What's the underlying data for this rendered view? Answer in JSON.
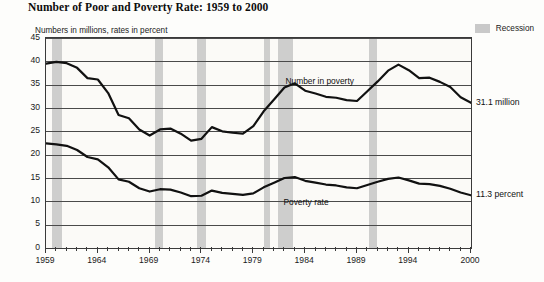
{
  "header": {
    "title": "Number of Poor and Poverty Rate:  1959 to 2000",
    "subtitle": "Numbers in millions, rates in percent",
    "legend_label": "Recession",
    "legend_color": "#c6c6c6"
  },
  "annotations": {
    "series1_inline": "Number in poverty",
    "series2_inline": "Poverty rate",
    "series1_end": "31.1 million",
    "series2_end": "11.3 percent"
  },
  "chart_data": {
    "type": "line",
    "title": "Number of Poor and Poverty Rate:  1959 to 2000",
    "subtitle": "Numbers in millions, rates in percent",
    "xlabel": "",
    "ylabel": "",
    "xlim": [
      1959,
      2000
    ],
    "ylim": [
      0,
      45
    ],
    "yticks": [
      0,
      5,
      10,
      15,
      20,
      25,
      30,
      35,
      40,
      45
    ],
    "xticks_labeled": [
      1959,
      1964,
      1969,
      1974,
      1979,
      1984,
      1989,
      1994,
      2000
    ],
    "xtick_interval": 1,
    "grid": true,
    "legend_position": "top-right",
    "x": [
      1959,
      1960,
      1961,
      1962,
      1963,
      1964,
      1965,
      1966,
      1967,
      1968,
      1969,
      1970,
      1971,
      1972,
      1973,
      1974,
      1975,
      1976,
      1977,
      1978,
      1979,
      1980,
      1981,
      1982,
      1983,
      1984,
      1985,
      1986,
      1987,
      1988,
      1989,
      1990,
      1991,
      1992,
      1993,
      1994,
      1995,
      1996,
      1997,
      1998,
      1999,
      2000
    ],
    "series": [
      {
        "name": "Number in poverty",
        "units": "millions",
        "end_label": "31.1 million",
        "values": [
          39.5,
          39.9,
          39.6,
          38.6,
          36.4,
          36.1,
          33.2,
          28.5,
          27.8,
          25.4,
          24.1,
          25.4,
          25.6,
          24.5,
          23.0,
          23.4,
          25.9,
          25.0,
          24.7,
          24.5,
          26.1,
          29.3,
          31.8,
          34.4,
          35.3,
          33.7,
          33.1,
          32.4,
          32.2,
          31.7,
          31.5,
          33.6,
          35.7,
          38.0,
          39.3,
          38.1,
          36.4,
          36.5,
          35.6,
          34.5,
          32.3,
          31.1
        ]
      },
      {
        "name": "Poverty rate",
        "units": "percent",
        "end_label": "11.3 percent",
        "values": [
          22.4,
          22.2,
          21.9,
          21.0,
          19.5,
          19.0,
          17.3,
          14.7,
          14.2,
          12.8,
          12.1,
          12.6,
          12.5,
          11.9,
          11.1,
          11.2,
          12.3,
          11.8,
          11.6,
          11.4,
          11.7,
          13.0,
          14.0,
          15.0,
          15.2,
          14.4,
          14.0,
          13.6,
          13.4,
          13.0,
          12.8,
          13.5,
          14.2,
          14.8,
          15.1,
          14.5,
          13.8,
          13.7,
          13.3,
          12.7,
          11.9,
          11.3
        ]
      }
    ],
    "recession_bands": [
      {
        "start": 1959.6,
        "end": 1960.5
      },
      {
        "start": 1969.5,
        "end": 1970.3
      },
      {
        "start": 1973.6,
        "end": 1974.4
      },
      {
        "start": 1980.0,
        "end": 1980.6
      },
      {
        "start": 1981.4,
        "end": 1982.8
      },
      {
        "start": 1990.2,
        "end": 1990.9
      }
    ]
  }
}
